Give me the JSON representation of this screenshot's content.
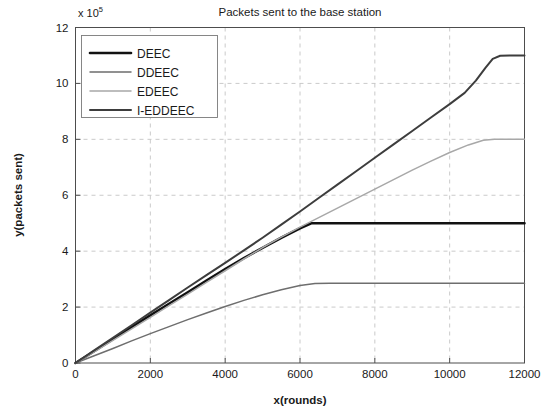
{
  "chart_data": {
    "type": "line",
    "title": "Packets sent to the base station",
    "xlabel": "x(rounds)",
    "ylabel": "y(packets sent)",
    "y_multiplier_text": "x 10",
    "y_multiplier_exponent": "5",
    "xlim": [
      0,
      12000
    ],
    "ylim": [
      0,
      12
    ],
    "xticks": [
      0,
      2000,
      4000,
      6000,
      8000,
      10000,
      12000
    ],
    "xtick_labels": [
      "0",
      "2000",
      "4000",
      "6000",
      "8000",
      "10000",
      "12000"
    ],
    "yticks": [
      0,
      2,
      4,
      6,
      8,
      10,
      12
    ],
    "ytick_labels": [
      "0",
      "2",
      "4",
      "6",
      "8",
      "10",
      "12"
    ],
    "grid": true,
    "legend_position": "top-left",
    "series": [
      {
        "name": "DEEC",
        "color": "#111111",
        "width": 2.6,
        "points": [
          [
            0,
            0
          ],
          [
            500,
            0.42
          ],
          [
            1000,
            0.85
          ],
          [
            1500,
            1.28
          ],
          [
            2000,
            1.7
          ],
          [
            2500,
            2.12
          ],
          [
            3000,
            2.53
          ],
          [
            3500,
            2.95
          ],
          [
            4000,
            3.36
          ],
          [
            4500,
            3.75
          ],
          [
            5000,
            4.12
          ],
          [
            5500,
            4.48
          ],
          [
            6000,
            4.82
          ],
          [
            6300,
            5.0
          ],
          [
            6600,
            5.0
          ],
          [
            7000,
            5.0
          ],
          [
            8000,
            5.0
          ],
          [
            9000,
            5.0
          ],
          [
            10000,
            5.0
          ],
          [
            11000,
            5.0
          ],
          [
            12000,
            5.0
          ]
        ]
      },
      {
        "name": "DDEEC",
        "color": "#6e6e6e",
        "width": 1.5,
        "points": [
          [
            0,
            0
          ],
          [
            500,
            0.26
          ],
          [
            1000,
            0.52
          ],
          [
            1500,
            0.79
          ],
          [
            2000,
            1.05
          ],
          [
            2500,
            1.3
          ],
          [
            3000,
            1.55
          ],
          [
            3500,
            1.79
          ],
          [
            4000,
            2.02
          ],
          [
            4500,
            2.24
          ],
          [
            5000,
            2.44
          ],
          [
            5500,
            2.62
          ],
          [
            6000,
            2.77
          ],
          [
            6400,
            2.84
          ],
          [
            6800,
            2.85
          ],
          [
            7500,
            2.85
          ],
          [
            8500,
            2.85
          ],
          [
            9500,
            2.85
          ],
          [
            10500,
            2.85
          ],
          [
            11500,
            2.85
          ],
          [
            12000,
            2.85
          ]
        ]
      },
      {
        "name": "EDEEC",
        "color": "#a8a8a8",
        "width": 1.5,
        "points": [
          [
            0,
            0
          ],
          [
            500,
            0.4
          ],
          [
            1000,
            0.81
          ],
          [
            1500,
            1.22
          ],
          [
            2000,
            1.63
          ],
          [
            2500,
            2.05
          ],
          [
            3000,
            2.46
          ],
          [
            3500,
            2.88
          ],
          [
            4000,
            3.3
          ],
          [
            4500,
            3.72
          ],
          [
            5000,
            4.13
          ],
          [
            5500,
            4.5
          ],
          [
            6000,
            4.86
          ],
          [
            6500,
            5.2
          ],
          [
            7000,
            5.54
          ],
          [
            7500,
            5.88
          ],
          [
            8000,
            6.22
          ],
          [
            8500,
            6.56
          ],
          [
            9000,
            6.9
          ],
          [
            9500,
            7.22
          ],
          [
            10000,
            7.53
          ],
          [
            10500,
            7.8
          ],
          [
            10900,
            7.97
          ],
          [
            11200,
            8.0
          ],
          [
            11600,
            8.0
          ],
          [
            12000,
            8.0
          ]
        ]
      },
      {
        "name": "I-EDDEEC",
        "color": "#3d3d3d",
        "width": 2.0,
        "points": [
          [
            0,
            0
          ],
          [
            500,
            0.45
          ],
          [
            1000,
            0.9
          ],
          [
            1500,
            1.35
          ],
          [
            2000,
            1.8
          ],
          [
            2500,
            2.25
          ],
          [
            3000,
            2.7
          ],
          [
            3500,
            3.14
          ],
          [
            4000,
            3.58
          ],
          [
            4500,
            4.03
          ],
          [
            5000,
            4.48
          ],
          [
            5500,
            4.95
          ],
          [
            6000,
            5.42
          ],
          [
            6500,
            5.9
          ],
          [
            7000,
            6.38
          ],
          [
            7500,
            6.86
          ],
          [
            8000,
            7.34
          ],
          [
            8500,
            7.82
          ],
          [
            9000,
            8.3
          ],
          [
            9500,
            8.78
          ],
          [
            10000,
            9.26
          ],
          [
            10400,
            9.66
          ],
          [
            10700,
            10.1
          ],
          [
            10950,
            10.55
          ],
          [
            11150,
            10.88
          ],
          [
            11350,
            10.99
          ],
          [
            11600,
            11.0
          ],
          [
            12000,
            11.0
          ]
        ]
      }
    ]
  }
}
